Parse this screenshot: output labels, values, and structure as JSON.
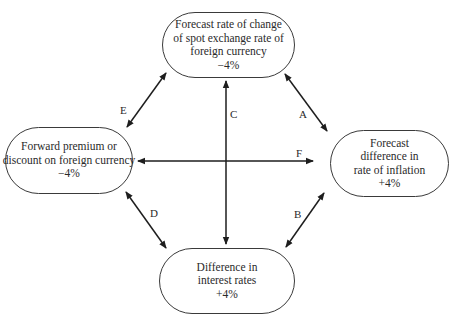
{
  "diagram": {
    "type": "interest-rate-parity-relationships",
    "nodes": {
      "top": {
        "lines": [
          "Forecast rate of change",
          "of spot exchange rate of",
          "foreign currency"
        ],
        "value": "−4%"
      },
      "left": {
        "lines": [
          "Forward premium or",
          "discount on foreign currency"
        ],
        "value": "−4%"
      },
      "right": {
        "lines": [
          "Forecast",
          "difference in",
          "rate of inflation"
        ],
        "value": "+4%"
      },
      "bottom": {
        "lines": [
          "Difference in",
          "interest rates"
        ],
        "value": "+4%"
      }
    },
    "edges": [
      {
        "label": "A",
        "from": "top",
        "to": "right"
      },
      {
        "label": "B",
        "from": "right",
        "to": "bottom"
      },
      {
        "label": "C",
        "from": "top",
        "to": "bottom"
      },
      {
        "label": "D",
        "from": "left",
        "to": "bottom"
      },
      {
        "label": "E",
        "from": "left",
        "to": "top"
      },
      {
        "label": "F",
        "from": "left",
        "to": "right"
      }
    ],
    "colors": {
      "line": "#1e1e1e",
      "text": "#2a2a2a",
      "background": "#ffffff"
    }
  }
}
